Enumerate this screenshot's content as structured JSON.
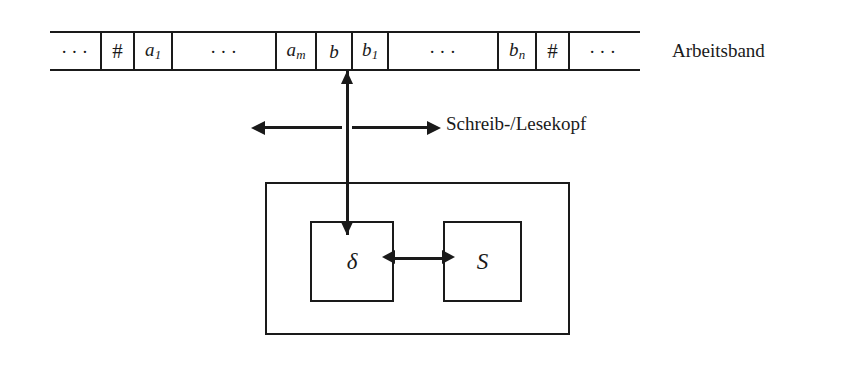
{
  "figure": {
    "title_text": "",
    "ink_color": "#1a1a1a",
    "background_color": "#ffffff"
  },
  "tape": {
    "label": "Arbeitsband",
    "cells": [
      {
        "kind": "ellipsis",
        "text": "···",
        "width": 50
      },
      {
        "kind": "symbol",
        "text": "#",
        "sub": "",
        "width": 33
      },
      {
        "kind": "symbol",
        "text": "a",
        "sub": "1",
        "width": 38
      },
      {
        "kind": "ellipsis",
        "text": "···",
        "width": 104
      },
      {
        "kind": "symbol",
        "text": "a",
        "sub": "m",
        "width": 40
      },
      {
        "kind": "symbol",
        "text": "b",
        "sub": "",
        "width": 36
      },
      {
        "kind": "symbol",
        "text": "b",
        "sub": "1",
        "width": 36
      },
      {
        "kind": "ellipsis",
        "text": "···",
        "width": 110
      },
      {
        "kind": "symbol",
        "text": "b",
        "sub": "n",
        "width": 38
      },
      {
        "kind": "symbol",
        "text": "#",
        "sub": "",
        "width": 33
      },
      {
        "kind": "ellipsis",
        "text": "···",
        "width": 68
      }
    ],
    "head_cell_index": 5
  },
  "head": {
    "label": "Schreib-/Lesekopf",
    "move_left_label": "",
    "move_right_label": ""
  },
  "control_unit": {
    "boxes": [
      {
        "id": "transition-function",
        "label": "δ"
      },
      {
        "id": "state-set",
        "label": "S"
      }
    ]
  }
}
